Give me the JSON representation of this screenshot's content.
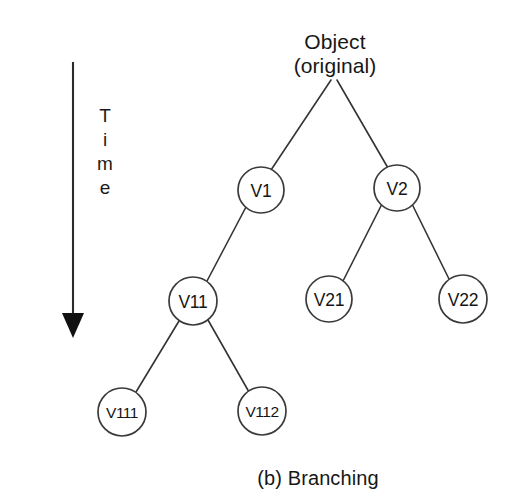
{
  "figure": {
    "caption": "(b) Branching",
    "background_color": "#ffffff",
    "stroke_color": "#333333",
    "node_fill_color": "#ffffff",
    "text_color": "#171717"
  },
  "time_axis": {
    "label_letters": [
      "T",
      "i",
      "m",
      "e"
    ],
    "direction": "downward",
    "arrow_icon": "down-arrow-icon"
  },
  "tree": {
    "root": {
      "id": "root",
      "line1": "Object",
      "line2": "(original)",
      "x": 335,
      "y": 54
    },
    "nodes": [
      {
        "id": "v1",
        "label": "V1",
        "x": 261,
        "y": 190,
        "r": 23,
        "small": false
      },
      {
        "id": "v2",
        "label": "V2",
        "x": 397,
        "y": 188,
        "r": 23,
        "small": false
      },
      {
        "id": "v11",
        "label": "V11",
        "x": 193,
        "y": 301,
        "r": 24,
        "small": false
      },
      {
        "id": "v21",
        "label": "V21",
        "x": 329,
        "y": 299,
        "r": 23,
        "small": false
      },
      {
        "id": "v22",
        "label": "V22",
        "x": 463,
        "y": 299,
        "r": 24,
        "small": false
      },
      {
        "id": "v111",
        "label": "V111",
        "x": 122,
        "y": 412,
        "r": 24,
        "small": true
      },
      {
        "id": "v112",
        "label": "V112",
        "x": 262,
        "y": 411,
        "r": 24,
        "small": true
      }
    ],
    "edges": [
      {
        "id": "root-v1",
        "from": "root",
        "to": "V1"
      },
      {
        "id": "root-v2",
        "from": "root",
        "to": "V2"
      },
      {
        "id": "v1-v11",
        "from": "V1",
        "to": "V11"
      },
      {
        "id": "v2-v21",
        "from": "V2",
        "to": "V21"
      },
      {
        "id": "v2-v22",
        "from": "V2",
        "to": "V22"
      },
      {
        "id": "v11-v111",
        "from": "V11",
        "to": "V111"
      },
      {
        "id": "v11-v112",
        "from": "V11",
        "to": "V112"
      }
    ]
  }
}
